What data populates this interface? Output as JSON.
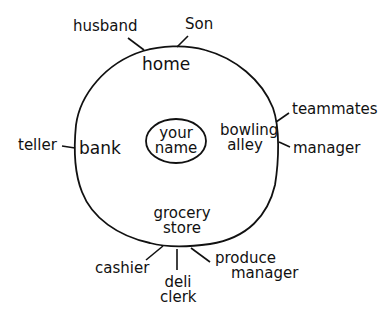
{
  "diagram": {
    "title": "",
    "center": {
      "line1": "your",
      "line2": "name"
    },
    "places": {
      "home": "home",
      "bank": "bank",
      "bowling": {
        "line1": "bowling",
        "line2": "alley"
      },
      "grocery": {
        "line1": "grocery",
        "line2": "store"
      }
    },
    "roles": {
      "husband": "husband",
      "son": "Son",
      "teller": "teller",
      "teammates": "teammates",
      "bowling_manager": "manager",
      "cashier": "cashier",
      "deli": {
        "line1": "deli",
        "line2": "clerk"
      },
      "produce": {
        "line1": "produce",
        "line2": "manager"
      }
    },
    "colors": {
      "ink": "#111111",
      "background": "#ffffff"
    }
  }
}
